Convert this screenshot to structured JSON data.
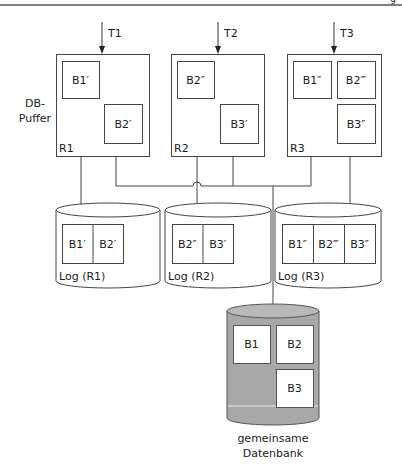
{
  "header": {
    "page_fragment": "g"
  },
  "buffer_label": [
    "DB-",
    "Puffer"
  ],
  "transactions": [
    {
      "label": "T1",
      "x": 102
    },
    {
      "label": "T2",
      "x": 218
    },
    {
      "label": "T3",
      "x": 334
    }
  ],
  "regions": [
    {
      "name": "R1",
      "x": 56,
      "y": 54,
      "w": 93,
      "h": 102,
      "blocks": [
        {
          "label": "B1′",
          "x": 62,
          "y": 61,
          "w": 37,
          "h": 37
        },
        {
          "label": "B2′",
          "x": 104,
          "y": 104,
          "w": 38,
          "h": 39
        }
      ]
    },
    {
      "name": "R2",
      "x": 171,
      "y": 54,
      "w": 93,
      "h": 102,
      "blocks": [
        {
          "label": "B2″",
          "x": 177,
          "y": 61,
          "w": 37,
          "h": 37
        },
        {
          "label": "B3′",
          "x": 220,
          "y": 104,
          "w": 38,
          "h": 39
        }
      ]
    },
    {
      "name": "R3",
      "x": 287,
      "y": 54,
      "w": 94,
      "h": 102,
      "blocks": [
        {
          "label": "B1″",
          "x": 293,
          "y": 61,
          "w": 38,
          "h": 37
        },
        {
          "label": "B2‴",
          "x": 337,
          "y": 61,
          "w": 38,
          "h": 37
        },
        {
          "label": "B3″",
          "x": 337,
          "y": 104,
          "w": 38,
          "h": 39
        }
      ]
    }
  ],
  "logs": [
    {
      "label": "Log (R1)",
      "x": 56,
      "w": 104,
      "blocks": [
        "B1′",
        "B2′"
      ],
      "bx": 62,
      "bw": 61
    },
    {
      "label": "Log (R2)",
      "x": 165,
      "w": 106,
      "blocks": [
        "B2″",
        "B3′"
      ],
      "bx": 172,
      "bw": 61
    },
    {
      "label": "Log (R3)",
      "x": 275,
      "w": 106,
      "blocks": [
        "B1″",
        "B2‴",
        "B3″"
      ],
      "bx": 282,
      "bw": 93
    }
  ],
  "database": {
    "label": [
      "gemeinsame",
      "Datenbank"
    ],
    "fill": "#a8a8a8",
    "top_fill": "#b8b8b8",
    "blocks": [
      {
        "label": "B1",
        "x": 233,
        "y": 325,
        "w": 37,
        "h": 38
      },
      {
        "label": "B2",
        "x": 276,
        "y": 325,
        "w": 37,
        "h": 38
      },
      {
        "label": "B3",
        "x": 276,
        "y": 369,
        "w": 37,
        "h": 38
      }
    ]
  }
}
